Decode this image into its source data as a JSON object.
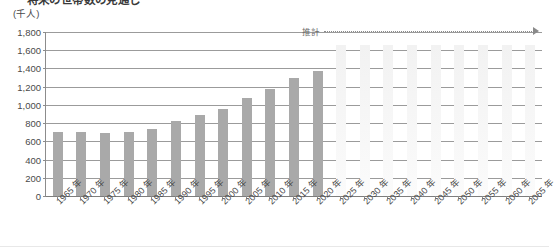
{
  "title": {
    "dash_prefix": "—",
    "text": "将来の世帯数の見通し"
  },
  "unit_label": "(千人)",
  "annotation": {
    "label": "推計",
    "arrow_icon": "right-arrow-icon"
  },
  "chart_data": {
    "type": "bar",
    "title": "将来の世帯数の見通し",
    "xlabel": "",
    "ylabel": "(千人)",
    "ylim": [
      0,
      1800
    ],
    "ytick_step": 200,
    "ytick_labels": [
      "1,800",
      "1,600",
      "1,400",
      "1,200",
      "1,000",
      "800",
      "600",
      "400",
      "200",
      "0"
    ],
    "ytick_values": [
      1800,
      1600,
      1400,
      1200,
      1000,
      800,
      600,
      400,
      200,
      0
    ],
    "grid": true,
    "legend_position": "none",
    "annotations": [
      {
        "text": "推計",
        "from_category": "2025 年",
        "to_category": "2065 年",
        "style": "dotted-arrow"
      }
    ],
    "categories": [
      "1965 年",
      "1970 年",
      "1975 年",
      "1980 年",
      "1985 年",
      "1990 年",
      "1995 年",
      "2000 年",
      "2005 年",
      "2010 年",
      "2015 年",
      "2020 年",
      "2025 年",
      "2030 年",
      "2035 年",
      "2040 年",
      "2045 年",
      "2050 年",
      "2055 年",
      "2060 年",
      "2065 年"
    ],
    "series": [
      {
        "name": "実績",
        "color": "#a9a9a9",
        "values": [
          700,
          700,
          690,
          700,
          740,
          820,
          890,
          960,
          1080,
          1180,
          1290,
          1370,
          null,
          null,
          null,
          null,
          null,
          null,
          null,
          null,
          null
        ]
      },
      {
        "name": "推計",
        "color": "#f5f5f5",
        "values": [
          null,
          null,
          null,
          null,
          null,
          null,
          null,
          null,
          null,
          null,
          null,
          null,
          1660,
          1660,
          1660,
          1660,
          1660,
          1660,
          1660,
          1660,
          1660
        ]
      }
    ]
  }
}
